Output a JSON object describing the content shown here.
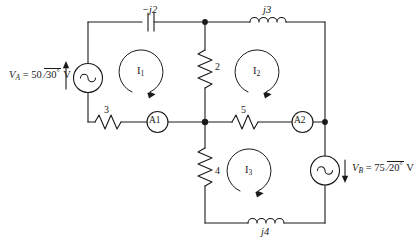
{
  "diagram": {
    "line_color": "#1a1a1a",
    "background": "#ffffff"
  },
  "sources": {
    "left": {
      "name": "V_A",
      "symbol": "sine-source",
      "label_prefix": "V",
      "label_sub": "A",
      "label_eq": "= 50",
      "label_angle": "30",
      "label_deg": "°",
      "label_unit": "V",
      "full_label": "V_A = 50 /30° V",
      "arrow": "up"
    },
    "right": {
      "name": "V_B",
      "symbol": "sine-source",
      "label_prefix": "V",
      "label_sub": "B",
      "label_eq": "= 75",
      "label_angle": "20",
      "label_deg": "°",
      "label_unit": "V",
      "full_label": "V_B = 75 /20° V",
      "arrow": "down"
    }
  },
  "components": {
    "capacitor_top_left": {
      "label": "−j2",
      "type": "capacitor"
    },
    "inductor_top_right": {
      "label": "j3",
      "type": "inductor"
    },
    "inductor_bottom": {
      "label": "j4",
      "type": "inductor"
    },
    "resistor_left_mid": {
      "label": "3",
      "type": "resistor"
    },
    "resistor_center_upper": {
      "label": "2",
      "type": "resistor"
    },
    "resistor_center_lower": {
      "label": "4",
      "type": "resistor"
    },
    "resistor_mid_right": {
      "label": "5",
      "type": "resistor"
    }
  },
  "meters": {
    "ammeter_1": {
      "label": "A1",
      "type": "ammeter"
    },
    "ammeter_2": {
      "label": "A2",
      "type": "ammeter"
    }
  },
  "mesh_currents": [
    {
      "label": "I",
      "sub": "1",
      "direction": "clockwise"
    },
    {
      "label": "I",
      "sub": "2",
      "direction": "clockwise"
    },
    {
      "label": "I",
      "sub": "3",
      "direction": "clockwise"
    }
  ]
}
